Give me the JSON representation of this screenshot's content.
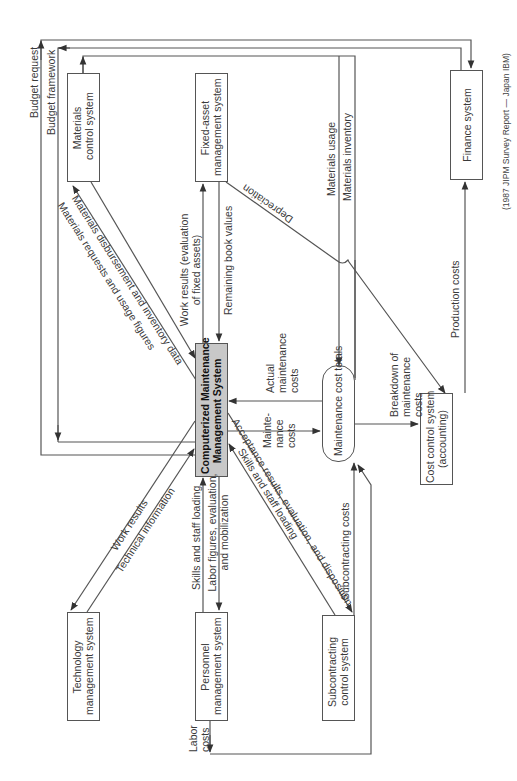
{
  "diagram": {
    "credit": "(1987 JIPM Survey Report  — Japan IBM)",
    "colors": {
      "line": "#555555",
      "center_fill": "#c8c8c8",
      "box_fill": "#ffffff",
      "text": "#333333"
    },
    "nodes": {
      "materials_control": {
        "line1": "Materials",
        "line2": "control system"
      },
      "fixed_asset": {
        "line1": "Fixed-asset",
        "line2": "management system"
      },
      "finance": {
        "line1": "Finance system"
      },
      "cmms": {
        "line1": "Computerized Maintenance",
        "line2": "Management System"
      },
      "maintenance_cost_totals": {
        "line1": "Maintenance cost totals"
      },
      "cost_control": {
        "line1": "Cost control system",
        "line2": "(accounting)"
      },
      "technology": {
        "line1": "Technology",
        "line2": "management system"
      },
      "personnel": {
        "line1": "Personnel",
        "line2": "management system"
      },
      "subcontracting": {
        "line1": "Subcontracting",
        "line2": "control system"
      }
    },
    "flows": {
      "budget_request": "Budget request",
      "budget_framework": "Budget framework",
      "materials_requests": "Materials requests and usage figures",
      "materials_disbursement": "Materials disbursement and inventory data",
      "work_results_fixed_1": "Work results (evaluation",
      "work_results_fixed_2": "of fixed assets)",
      "remaining_book_values": "Remaining book values",
      "depreciation": "Depreciation",
      "materials_usage": "Materials usage",
      "materials_inventory": "Materials inventory",
      "production_costs": "Production costs",
      "actual_maint_1": "Actual",
      "actual_maint_2": "maintenance",
      "actual_maint_3": "costs",
      "maint_costs_1": "Mainte-",
      "maint_costs_2": "nance",
      "maint_costs_3": "costs",
      "breakdown_1": "Breakdown of",
      "breakdown_2": "maintenance",
      "breakdown_3": "costs",
      "work_results": "Work results",
      "technical_information": "Technical information",
      "skills_staff_loading": "Skills and staff loading",
      "labor_figures_1": "Labor figures, evaluation,",
      "labor_figures_2": "and mobilization",
      "skills_staff_loading_sub": "Skills and staff loading",
      "acceptance_results": "Acceptance results, evaluation, and disposition",
      "subcontracting_costs": "Subcontracting costs",
      "labor_costs_1": "Labor",
      "labor_costs_2": "costs"
    }
  }
}
